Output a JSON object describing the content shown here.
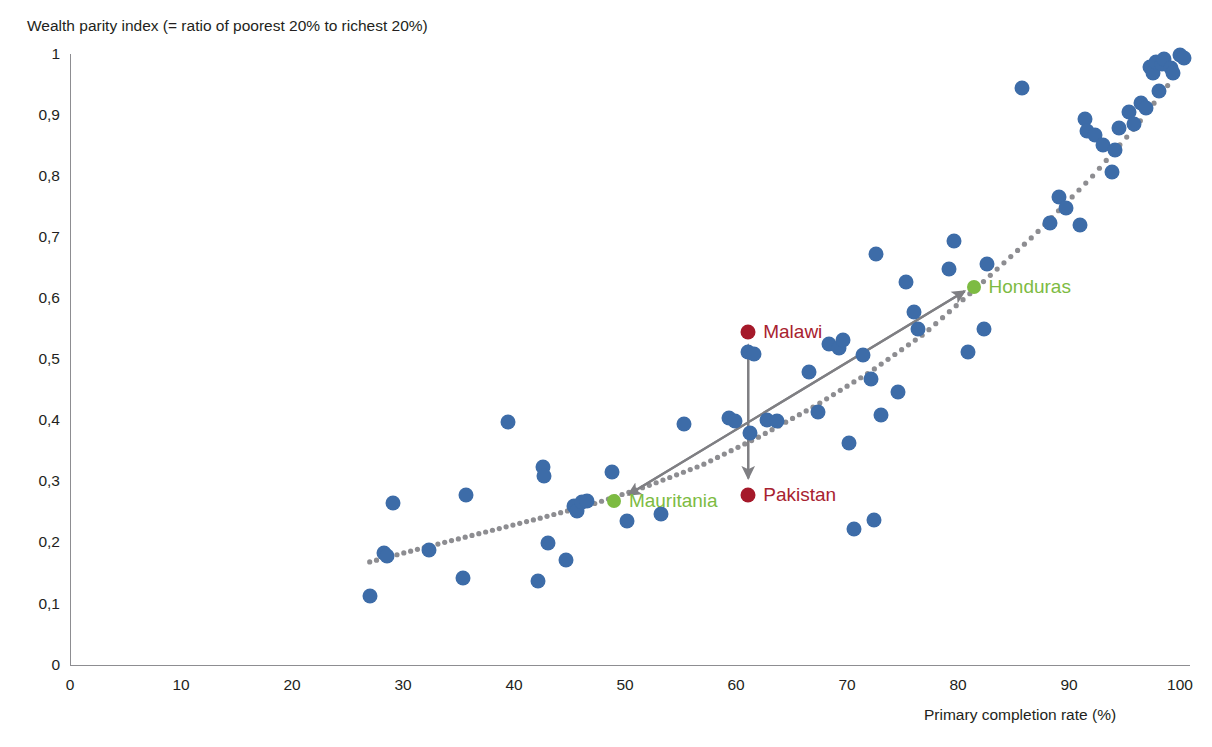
{
  "axes": {
    "y_title": "Wealth parity index (= ratio of poorest 20% to richest 20%)",
    "x_title": "Primary completion rate (%)",
    "y_ticks": [
      "0",
      "0,1",
      "0,2",
      "0,3",
      "0,4",
      "0,5",
      "0,6",
      "0,7",
      "0,8",
      "0,9",
      "1"
    ],
    "x_ticks": [
      "0",
      "10",
      "20",
      "30",
      "40",
      "50",
      "60",
      "70",
      "80",
      "90",
      "100"
    ]
  },
  "annotations": {
    "malawi": "Malawi",
    "pakistan": "Pakistan",
    "mauritania": "Mauritania",
    "honduras": "Honduras"
  },
  "colors": {
    "scatter_blue": "#3d6ca8",
    "highlight_green": "#7dbb42",
    "highlight_red": "#a5192a",
    "trendline_gray": "#8d8d91",
    "arrow_gray": "#7f7f83",
    "axis_gray": "#8d8d91",
    "text": "#231f20"
  },
  "chart_data": {
    "type": "scatter",
    "title": "",
    "xlabel": "Primary completion rate (%)",
    "ylabel": "Wealth parity index (= ratio of poorest 20% to richest 20%)",
    "xlim": [
      0,
      100
    ],
    "ylim": [
      0,
      1
    ],
    "xticks": [
      0,
      10,
      20,
      30,
      40,
      50,
      60,
      70,
      80,
      90,
      100
    ],
    "yticks": [
      0,
      0.1,
      0.2,
      0.3,
      0.4,
      0.5,
      0.6,
      0.7,
      0.8,
      0.9,
      1
    ],
    "grid": false,
    "legend": "none",
    "series": [
      {
        "name": "Countries",
        "color": "#3d6ca8",
        "points": [
          [
            27.0,
            0.113
          ],
          [
            28.3,
            0.183
          ],
          [
            28.6,
            0.177
          ],
          [
            29.1,
            0.265
          ],
          [
            32.3,
            0.187
          ],
          [
            35.4,
            0.141
          ],
          [
            35.7,
            0.277
          ],
          [
            39.5,
            0.397
          ],
          [
            42.2,
            0.137
          ],
          [
            42.6,
            0.323
          ],
          [
            42.7,
            0.309
          ],
          [
            43.1,
            0.199
          ],
          [
            44.7,
            0.171
          ],
          [
            45.4,
            0.259
          ],
          [
            45.7,
            0.252
          ],
          [
            46.1,
            0.266
          ],
          [
            46.6,
            0.267
          ],
          [
            48.8,
            0.316
          ],
          [
            50.2,
            0.235
          ],
          [
            53.2,
            0.246
          ],
          [
            55.3,
            0.393
          ],
          [
            59.4,
            0.403
          ],
          [
            59.9,
            0.399
          ],
          [
            61.1,
            0.511
          ],
          [
            61.6,
            0.509
          ],
          [
            61.3,
            0.379
          ],
          [
            62.8,
            0.401
          ],
          [
            63.7,
            0.399
          ],
          [
            66.6,
            0.479
          ],
          [
            67.4,
            0.413
          ],
          [
            68.4,
            0.525
          ],
          [
            69.3,
            0.518
          ],
          [
            69.6,
            0.531
          ],
          [
            70.2,
            0.363
          ],
          [
            70.6,
            0.222
          ],
          [
            71.4,
            0.507
          ],
          [
            72.2,
            0.467
          ],
          [
            72.4,
            0.237
          ],
          [
            72.6,
            0.672
          ],
          [
            73.1,
            0.408
          ],
          [
            74.6,
            0.446
          ],
          [
            75.3,
            0.627
          ],
          [
            76.0,
            0.577
          ],
          [
            76.4,
            0.549
          ],
          [
            79.2,
            0.647
          ],
          [
            79.6,
            0.694
          ],
          [
            80.9,
            0.511
          ],
          [
            82.3,
            0.549
          ],
          [
            82.6,
            0.655
          ],
          [
            85.8,
            0.943
          ],
          [
            88.3,
            0.723
          ],
          [
            89.1,
            0.766
          ],
          [
            89.7,
            0.747
          ],
          [
            91.0,
            0.719
          ],
          [
            91.4,
            0.893
          ],
          [
            91.6,
            0.874
          ],
          [
            92.3,
            0.866
          ],
          [
            93.1,
            0.851
          ],
          [
            93.9,
            0.806
          ],
          [
            94.1,
            0.843
          ],
          [
            94.5,
            0.878
          ],
          [
            95.4,
            0.905
          ],
          [
            95.9,
            0.884
          ],
          [
            96.5,
            0.919
          ],
          [
            96.9,
            0.911
          ],
          [
            97.3,
            0.978
          ],
          [
            97.6,
            0.968
          ],
          [
            97.8,
            0.986
          ],
          [
            98.1,
            0.938
          ],
          [
            98.4,
            0.983
          ],
          [
            98.6,
            0.991
          ],
          [
            99.2,
            0.976
          ],
          [
            99.4,
            0.968
          ],
          [
            100.0,
            0.998
          ],
          [
            100.4,
            0.992
          ]
        ]
      },
      {
        "name": "Highlighted countries",
        "color": "#7dbb42",
        "points": [
          [
            49.0,
            0.268
          ],
          [
            81.4,
            0.618
          ]
        ]
      }
    ],
    "trendline": {
      "style": "dotted",
      "color": "#8d8d91",
      "points": [
        [
          27.0,
          0.168
        ],
        [
          32.0,
          0.192
        ],
        [
          37.0,
          0.215
        ],
        [
          42.0,
          0.238
        ],
        [
          47.0,
          0.262
        ],
        [
          52.0,
          0.292
        ],
        [
          57.0,
          0.327
        ],
        [
          62.0,
          0.372
        ],
        [
          67.0,
          0.422
        ],
        [
          72.0,
          0.478
        ],
        [
          77.0,
          0.542
        ],
        [
          82.0,
          0.622
        ],
        [
          87.0,
          0.705
        ],
        [
          92.0,
          0.797
        ],
        [
          96.0,
          0.88
        ],
        [
          99.5,
          0.962
        ]
      ]
    },
    "annotations": [
      {
        "label": "Malawi",
        "x": 61.1,
        "y": 0.545,
        "color": "#a5192a",
        "marker": "dot"
      },
      {
        "label": "Pakistan",
        "x": 61.1,
        "y": 0.278,
        "color": "#a5192a",
        "marker": "dot"
      },
      {
        "label": "Mauritania",
        "x": 49.0,
        "y": 0.268,
        "color": "#7dbb42",
        "marker": "dot"
      },
      {
        "label": "Honduras",
        "x": 81.4,
        "y": 0.618,
        "color": "#7dbb42",
        "marker": "dot"
      }
    ],
    "arrows": [
      {
        "name": "vertical-range-arrow",
        "from": [
          61.1,
          0.305
        ],
        "to": [
          61.1,
          0.523
        ],
        "double_headed": true,
        "color": "#7f7f83"
      },
      {
        "name": "diagonal-trend-arrow",
        "from": [
          50.3,
          0.278
        ],
        "to": [
          80.6,
          0.611
        ],
        "double_headed": true,
        "color": "#7f7f83"
      }
    ]
  }
}
